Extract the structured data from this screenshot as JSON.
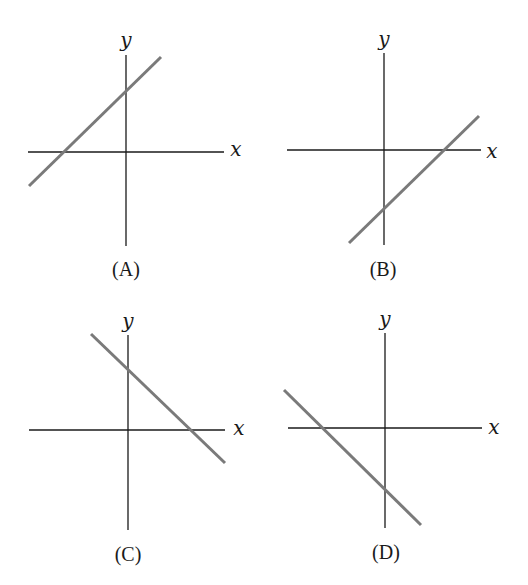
{
  "panels": [
    {
      "label": "(A)",
      "x_axis_label": "x",
      "y_axis_label": "y",
      "slope": "positive",
      "y_intercept": "positive",
      "x_intercept": "negative"
    },
    {
      "label": "(B)",
      "x_axis_label": "x",
      "y_axis_label": "y",
      "slope": "positive",
      "y_intercept": "negative",
      "x_intercept": "positive"
    },
    {
      "label": "(C)",
      "x_axis_label": "x",
      "y_axis_label": "y",
      "slope": "negative",
      "y_intercept": "positive",
      "x_intercept": "positive"
    },
    {
      "label": "(D)",
      "x_axis_label": "x",
      "y_axis_label": "y",
      "slope": "negative",
      "y_intercept": "negative",
      "x_intercept": "negative"
    }
  ],
  "colors": {
    "axis": "#1a1a1a",
    "line": "#7a7a7a",
    "background": "#ffffff"
  }
}
